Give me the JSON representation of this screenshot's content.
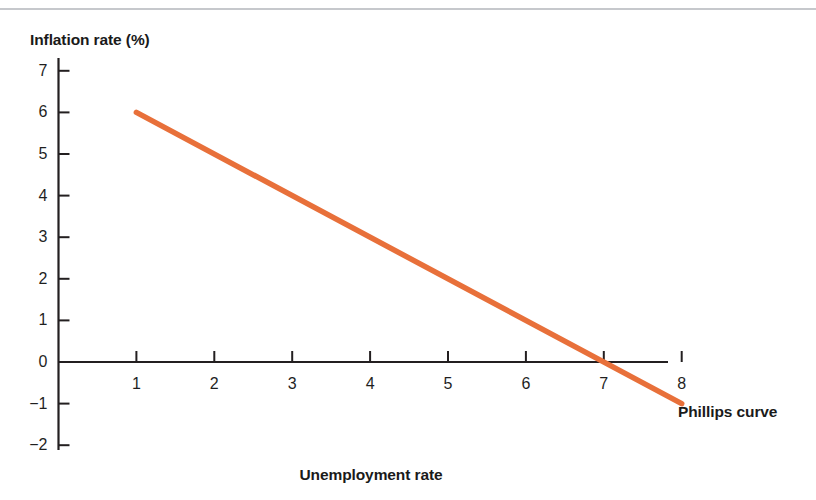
{
  "figure": {
    "y_axis_title": "Inflation rate (%)",
    "x_axis_title": "Unemployment rate",
    "curve_label": "Phillips curve",
    "accent_color": "#e8703a",
    "axis_color": "#231f20",
    "top_rule_color": "#c6c8cc"
  },
  "chart_data": {
    "type": "line",
    "title": "",
    "xlabel": "Unemployment rate",
    "ylabel": "Inflation rate (%)",
    "xlim": [
      0,
      8
    ],
    "ylim": [
      -2,
      7
    ],
    "grid": false,
    "legend": "inline-annotation",
    "xticks": [
      "1",
      "2",
      "3",
      "4",
      "5",
      "6",
      "7",
      "8"
    ],
    "xtick_values": [
      1,
      2,
      3,
      4,
      5,
      6,
      7,
      8
    ],
    "yticks": [
      "7",
      "6",
      "5",
      "4",
      "3",
      "2",
      "1",
      "0",
      "−1",
      "−2"
    ],
    "ytick_values": [
      7,
      6,
      5,
      4,
      3,
      2,
      1,
      0,
      -1,
      -2
    ],
    "series": [
      {
        "name": "Phillips curve",
        "color": "#e8703a",
        "x": [
          1,
          8
        ],
        "values": [
          6,
          -1
        ],
        "annotation": "Phillips curve",
        "x_intercept": 7
      }
    ]
  }
}
